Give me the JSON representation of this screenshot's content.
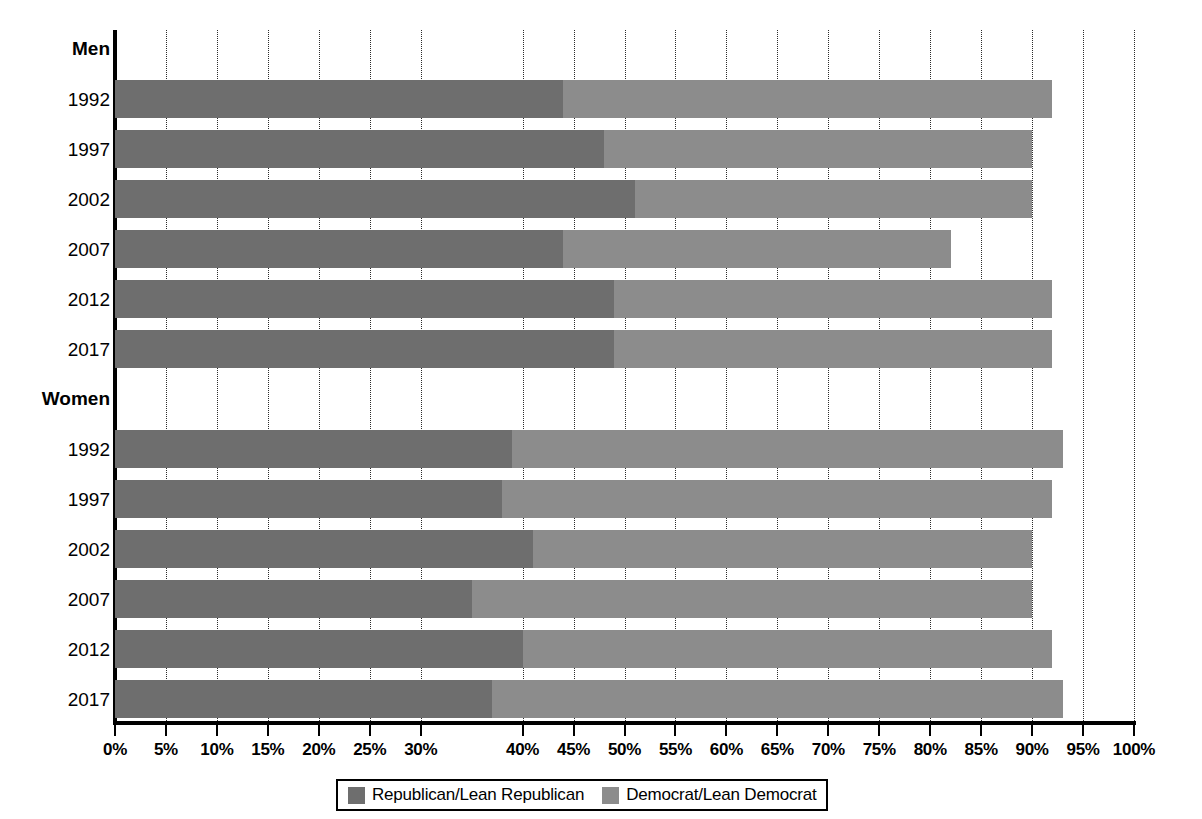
{
  "chart_data": {
    "type": "bar",
    "orientation": "horizontal",
    "stacked": true,
    "title": "",
    "subtitle": "",
    "xlabel": "",
    "ylabel": "",
    "xlim": [
      0,
      100
    ],
    "xticks": [
      0,
      5,
      10,
      15,
      20,
      25,
      30,
      40,
      45,
      50,
      55,
      60,
      65,
      70,
      75,
      80,
      85,
      90,
      95,
      100
    ],
    "xtick_labels": [
      "0%",
      "5%",
      "10%",
      "15%",
      "20%",
      "25%",
      "30%",
      "40%",
      "45%",
      "50%",
      "55%",
      "60%",
      "65%",
      "70%",
      "75%",
      "80%",
      "85%",
      "90%",
      "95%",
      "100%"
    ],
    "grid": "vertical-dotted",
    "legend_position": "bottom-center",
    "series": [
      {
        "name": "Republican/Lean Republican",
        "color": "#6e6e6e"
      },
      {
        "name": "Democrat/Lean Democrat",
        "color": "#8c8c8c"
      }
    ],
    "groups": [
      {
        "label": "Men",
        "rows": [
          {
            "label": "1992",
            "republican": 44,
            "democrat": 48,
            "total": 92
          },
          {
            "label": "1997",
            "republican": 48,
            "democrat": 42,
            "total": 90
          },
          {
            "label": "2002",
            "republican": 51,
            "democrat": 39,
            "total": 90
          },
          {
            "label": "2007",
            "republican": 44,
            "democrat": 38,
            "total": 82
          },
          {
            "label": "2012",
            "republican": 49,
            "democrat": 43,
            "total": 92
          },
          {
            "label": "2017",
            "republican": 49,
            "democrat": 43,
            "total": 92
          }
        ]
      },
      {
        "label": "Women",
        "rows": [
          {
            "label": "1992",
            "republican": 39,
            "democrat": 54,
            "total": 93
          },
          {
            "label": "1997",
            "republican": 38,
            "democrat": 54,
            "total": 92
          },
          {
            "label": "2002",
            "republican": 41,
            "democrat": 49,
            "total": 90
          },
          {
            "label": "2007",
            "republican": 35,
            "democrat": 55,
            "total": 90
          },
          {
            "label": "2012",
            "republican": 40,
            "democrat": 52,
            "total": 92
          },
          {
            "label": "2017",
            "republican": 37,
            "democrat": 56,
            "total": 93
          }
        ]
      }
    ]
  },
  "legend": {
    "items": [
      {
        "label": "Republican/Lean Republican",
        "color": "#6e6e6e"
      },
      {
        "label": "Democrat/Lean Democrat",
        "color": "#8c8c8c"
      }
    ]
  }
}
